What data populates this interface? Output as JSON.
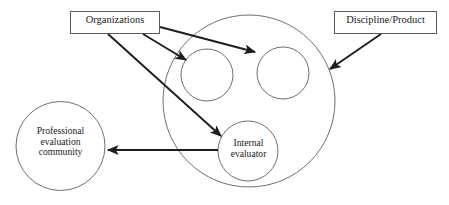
{
  "diagram": {
    "background_color": "#ffffff",
    "shape_stroke_color": "#6f6f6f",
    "arrow_color": "#1d1d1d",
    "box_stroke_color": "#5a5a5a",
    "text_color": "#1a1a1a",
    "boxes": [
      {
        "id": "organizations",
        "label": "Organizations"
      },
      {
        "id": "discipline_product",
        "label": "Discipline/Product"
      }
    ],
    "circles": [
      {
        "id": "outer_context",
        "label": ""
      },
      {
        "id": "small_circle_left",
        "label": ""
      },
      {
        "id": "small_circle_right",
        "label": ""
      },
      {
        "id": "internal_evaluator",
        "label": "Internal\nevaluator"
      },
      {
        "id": "professional_evaluation_community",
        "label": "Professional\nevaluation\ncommunity"
      }
    ],
    "arrows": [
      {
        "id": "organizations-to-small-circle-left",
        "from": "organizations",
        "to": "small_circle_left"
      },
      {
        "id": "organizations-to-small-circle-right",
        "from": "organizations",
        "to": "small_circle_right"
      },
      {
        "id": "organizations-to-internal-evaluator",
        "from": "organizations",
        "to": "internal_evaluator"
      },
      {
        "id": "discipline-product-to-outer-context",
        "from": "discipline_product",
        "to": "outer_context"
      },
      {
        "id": "internal-evaluator-to-community",
        "from": "internal_evaluator",
        "to": "professional_evaluation_community"
      }
    ]
  }
}
